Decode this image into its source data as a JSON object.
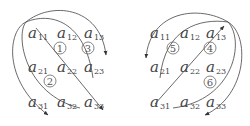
{
  "diagram": {
    "left": {
      "elements": [
        {
          "name": "a",
          "sub": "11",
          "x": 28,
          "y": 38
        },
        {
          "name": "a",
          "sub": "12",
          "x": 57,
          "y": 38
        },
        {
          "name": "a",
          "sub": "13",
          "x": 84,
          "y": 38
        },
        {
          "name": "a",
          "sub": "21",
          "x": 28,
          "y": 72
        },
        {
          "name": "a",
          "sub": "22",
          "x": 57,
          "y": 72
        },
        {
          "name": "a",
          "sub": "23",
          "x": 84,
          "y": 72
        },
        {
          "name": "a",
          "sub": "31",
          "x": 28,
          "y": 107
        },
        {
          "name": "a",
          "sub": "32",
          "x": 57,
          "y": 107
        },
        {
          "name": "a",
          "sub": "33",
          "x": 84,
          "y": 107
        }
      ],
      "markers": [
        {
          "label": "1",
          "x": 60,
          "y": 48
        },
        {
          "label": "3",
          "x": 88,
          "y": 48
        },
        {
          "label": "2",
          "x": 50,
          "y": 81
        }
      ]
    },
    "right": {
      "elements": [
        {
          "name": "a",
          "sub": "11",
          "x": 150,
          "y": 38
        },
        {
          "name": "a",
          "sub": "12",
          "x": 180,
          "y": 38
        },
        {
          "name": "a",
          "sub": "13",
          "x": 206,
          "y": 38
        },
        {
          "name": "a",
          "sub": "21",
          "x": 150,
          "y": 72
        },
        {
          "name": "a",
          "sub": "22",
          "x": 180,
          "y": 72
        },
        {
          "name": "a",
          "sub": "23",
          "x": 206,
          "y": 72
        },
        {
          "name": "a",
          "sub": "31",
          "x": 150,
          "y": 107
        },
        {
          "name": "a",
          "sub": "32",
          "x": 180,
          "y": 107
        },
        {
          "name": "a",
          "sub": "33",
          "x": 206,
          "y": 107
        }
      ],
      "markers": [
        {
          "label": "5",
          "x": 173,
          "y": 48
        },
        {
          "label": "4",
          "x": 210,
          "y": 48
        },
        {
          "label": "6",
          "x": 210,
          "y": 82
        }
      ]
    }
  }
}
